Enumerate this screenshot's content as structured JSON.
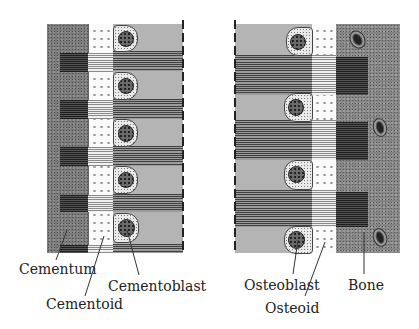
{
  "figure": {
    "left_panel": {
      "title": "Cementum formation",
      "labels": {
        "cementum": "Cementum",
        "cementoid": "Cementoid",
        "cementoblast": "Cementoblast"
      }
    },
    "right_panel": {
      "title": "Bone formation",
      "labels": {
        "osteoblast": "Osteoblast",
        "osteoid": "Osteoid",
        "bone": "Bone"
      }
    },
    "colors": {
      "mineralized_tissue": "#7a7a7a",
      "unmineralized_matrix": "#fbfbfb",
      "periodontal_ligament": "#b4b4b4",
      "fibers": "#3a3a3a",
      "text": "#222222"
    }
  }
}
